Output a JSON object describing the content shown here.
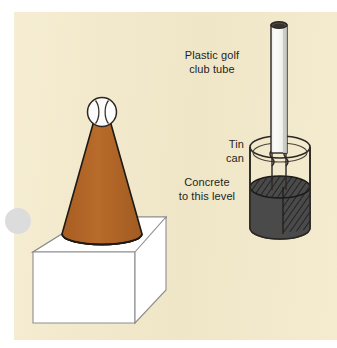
{
  "figure": {
    "background_color": "#f4eacb",
    "page_color": "#ffffff"
  },
  "labels": {
    "tube": "Plastic golf\nclub tube",
    "can": "Tin\ncan",
    "concrete": "Concrete\nto this level"
  },
  "objects": {
    "ball": {
      "name": "baseball",
      "color": "#fdfdfb",
      "outline": "#2b2724"
    },
    "cone": {
      "name": "cone",
      "color": "#b06426",
      "outline": "#1d1a17"
    },
    "box": {
      "name": "box",
      "color": "#ffffff",
      "outline": "#8d8d8d"
    },
    "tube": {
      "name": "plastic-golf-club-tube",
      "color": "#f7f7f5",
      "outline": "#2b2724",
      "shade": "#c9c9c4"
    },
    "can": {
      "name": "tin-can",
      "color": "transparent",
      "outline": "#2b2724"
    },
    "concrete": {
      "name": "concrete-fill",
      "color": "#4a4a4a",
      "hatch": "#2b2b2b",
      "outline": "#1d1a17"
    }
  },
  "colors": {
    "ink": "#231f1c",
    "cone_brown": "#b06426",
    "concrete_gray": "#4a4a4a",
    "outline": "#2b2724",
    "box_line": "#8d8d8d"
  }
}
